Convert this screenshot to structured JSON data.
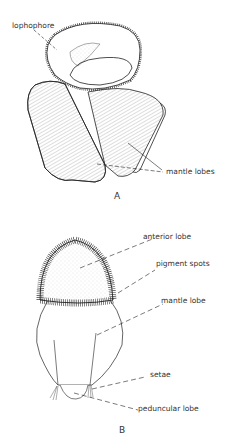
{
  "figure_a": {
    "caption": "A",
    "labels": {
      "lophophore": "lophophore",
      "mantle_lobes": "mantle lobes"
    }
  },
  "figure_b": {
    "caption": "B",
    "labels": {
      "anterior_lobe": "anterior lobe",
      "pigment_spots": "pigment spots",
      "mantle_lobe": "mantle lobe",
      "setae": "setae",
      "peduncular_lobe": "peduncular lobe"
    }
  }
}
